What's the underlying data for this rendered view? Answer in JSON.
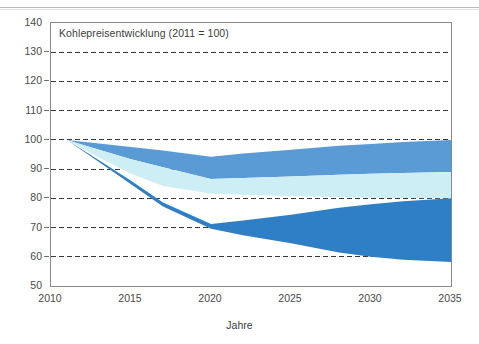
{
  "figure": {
    "width": 479,
    "height": 344,
    "background": "#ffffff",
    "top_rule_color": "#b9b9b9"
  },
  "chart_data": {
    "type": "area",
    "title": "Kohlepreisentwicklung (2011 = 100)",
    "subtitle": "",
    "xlabel": "Jahre",
    "ylabel": "",
    "xlim": [
      2010,
      2035
    ],
    "ylim": [
      50,
      140
    ],
    "xticks": [
      2010,
      2015,
      2020,
      2025,
      2030,
      2035
    ],
    "yticks": [
      50,
      60,
      70,
      80,
      90,
      100,
      110,
      120,
      130,
      140
    ],
    "xtick_labels": [
      "2010",
      "2015",
      "2020",
      "2025",
      "2030",
      "2035"
    ],
    "ytick_labels": [
      "50",
      "60",
      "70",
      "80",
      "90",
      "100",
      "110",
      "120",
      "130",
      "140"
    ],
    "grid": true,
    "grid_axis": "y",
    "grid_style": "dashed",
    "grid_color": "#3a3a3a",
    "legend": false,
    "legend_position": "none",
    "annotations": [
      {
        "text": "Kohlepreisentwicklung (2011 = 100)",
        "x": 2010.6,
        "y": 136
      }
    ],
    "colors": {
      "band_upper": "#5b9bd5",
      "band_middle": "#cdeef5",
      "band_lower": "#2e7fc6",
      "axis": "#8a8a8a",
      "text": "#4a4a4a"
    },
    "bands": [
      {
        "name": "upper-corridor",
        "color": "#5b9bd5",
        "x": [
          2011,
          2013,
          2015,
          2017,
          2020,
          2022,
          2025,
          2028,
          2030,
          2032,
          2035
        ],
        "upper": [
          100.0,
          98.8,
          97.6,
          96.4,
          94.2,
          95.3,
          96.6,
          98.0,
          98.6,
          99.3,
          100.0
        ],
        "lower": [
          100.0,
          96.6,
          93.4,
          90.6,
          86.6,
          87.0,
          87.5,
          88.1,
          88.4,
          88.7,
          89.0
        ]
      },
      {
        "name": "middle-corridor",
        "color": "#cdeef5",
        "x": [
          2011,
          2013,
          2015,
          2017,
          2020,
          2022,
          2025,
          2028,
          2030,
          2032,
          2035
        ],
        "upper": [
          100.0,
          96.6,
          93.4,
          90.6,
          86.6,
          87.0,
          87.5,
          88.1,
          88.4,
          88.7,
          89.0
        ],
        "lower": [
          100.0,
          94.0,
          88.4,
          84.2,
          81.6,
          81.2,
          80.8,
          80.4,
          80.2,
          80.1,
          80.0
        ]
      },
      {
        "name": "lower-corridor",
        "color": "#2e7fc6",
        "x": [
          2011,
          2013,
          2015,
          2017,
          2020,
          2022,
          2025,
          2028,
          2030,
          2032,
          2035
        ],
        "upper": [
          100.0,
          93.0,
          86.0,
          78.6,
          71.2,
          72.4,
          74.4,
          76.8,
          78.0,
          79.0,
          80.0
        ],
        "lower": [
          100.0,
          92.4,
          84.8,
          77.2,
          69.6,
          67.4,
          64.6,
          61.5,
          60.0,
          59.0,
          58.2
        ]
      }
    ]
  }
}
